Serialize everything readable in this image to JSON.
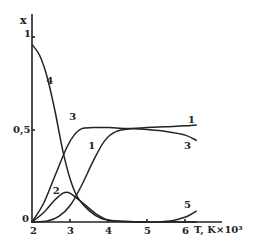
{
  "chart_data": {
    "type": "line",
    "title": "",
    "xlabel": "T, K×10³",
    "ylabel": "x",
    "xlim": [
      2,
      6.5
    ],
    "ylim": [
      0,
      1.05
    ],
    "x_ticks": [
      "2",
      "3",
      "4",
      "5",
      "6"
    ],
    "y_ticks": [
      "0",
      "0,5",
      "1"
    ],
    "grid": false,
    "legend": "inline curve numbers",
    "series": [
      {
        "name": "1",
        "points": [
          [
            2.0,
            0.0
          ],
          [
            2.4,
            0.005
          ],
          [
            2.7,
            0.03
          ],
          [
            3.0,
            0.09
          ],
          [
            3.3,
            0.2
          ],
          [
            3.6,
            0.33
          ],
          [
            3.9,
            0.44
          ],
          [
            4.2,
            0.49
          ],
          [
            4.6,
            0.505
          ],
          [
            5.0,
            0.51
          ],
          [
            5.5,
            0.515
          ],
          [
            6.0,
            0.52
          ],
          [
            6.3,
            0.525
          ]
        ]
      },
      {
        "name": "2",
        "points": [
          [
            2.0,
            0.0
          ],
          [
            2.3,
            0.05
          ],
          [
            2.6,
            0.12
          ],
          [
            2.8,
            0.155
          ],
          [
            2.95,
            0.16
          ],
          [
            3.1,
            0.14
          ],
          [
            3.4,
            0.09
          ],
          [
            3.7,
            0.04
          ],
          [
            4.0,
            0.01
          ],
          [
            4.5,
            0.002
          ],
          [
            5.0,
            0.0
          ]
        ]
      },
      {
        "name": "3",
        "points": [
          [
            2.0,
            0.0
          ],
          [
            2.3,
            0.1
          ],
          [
            2.6,
            0.25
          ],
          [
            2.9,
            0.4
          ],
          [
            3.1,
            0.47
          ],
          [
            3.3,
            0.505
          ],
          [
            3.6,
            0.51
          ],
          [
            4.0,
            0.51
          ],
          [
            4.5,
            0.505
          ],
          [
            5.0,
            0.5
          ],
          [
            5.5,
            0.49
          ],
          [
            6.0,
            0.47
          ],
          [
            6.3,
            0.44
          ]
        ]
      },
      {
        "name": "4",
        "points": [
          [
            2.0,
            0.96
          ],
          [
            2.2,
            0.9
          ],
          [
            2.4,
            0.78
          ],
          [
            2.6,
            0.6
          ],
          [
            2.8,
            0.39
          ],
          [
            3.0,
            0.23
          ],
          [
            3.2,
            0.13
          ],
          [
            3.5,
            0.06
          ],
          [
            3.8,
            0.02
          ],
          [
            4.2,
            0.005
          ],
          [
            5.0,
            0.0
          ],
          [
            6.3,
            0.0
          ]
        ]
      },
      {
        "name": "5",
        "points": [
          [
            5.3,
            0.0
          ],
          [
            5.6,
            0.005
          ],
          [
            5.9,
            0.02
          ],
          [
            6.1,
            0.035
          ],
          [
            6.3,
            0.06
          ]
        ]
      }
    ],
    "curve_labels": [
      {
        "name": "4",
        "x": 2.45,
        "y": 0.76
      },
      {
        "name": "3",
        "x": 3.05,
        "y": 0.57
      },
      {
        "name": "1",
        "x": 3.55,
        "y": 0.41
      },
      {
        "name": "2",
        "x": 2.62,
        "y": 0.17
      },
      {
        "name": "1",
        "x": 6.15,
        "y": 0.55
      },
      {
        "name": "3",
        "x": 6.05,
        "y": 0.41
      },
      {
        "name": "5",
        "x": 6.05,
        "y": 0.09
      }
    ]
  },
  "axis": {
    "y_label": "x",
    "x_label": "T, K×10³",
    "y_tick_1": "1",
    "y_tick_05": "0,5",
    "y_tick_0": "0",
    "x_tick_2": "2",
    "x_tick_3": "3",
    "x_tick_4": "4",
    "x_tick_5": "5",
    "x_tick_6": "6"
  },
  "style": {
    "line_color": "#222222",
    "background": "#ffffff"
  }
}
